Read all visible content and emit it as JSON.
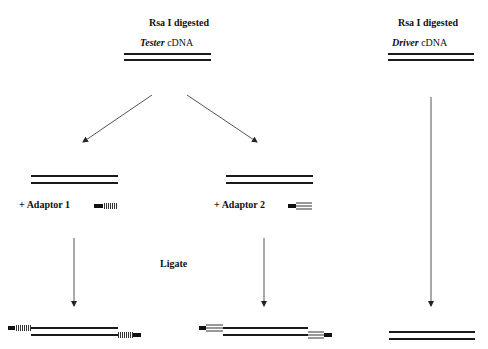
{
  "diagram": {
    "tester": {
      "header_line1": "Rsa I digested",
      "header_italic": "Tester",
      "header_suffix": " cDNA"
    },
    "driver": {
      "header_line1": "Rsa I digested",
      "header_italic": "Driver",
      "header_suffix": " cDNA"
    },
    "branch1": {
      "label": "+ Adaptor 1",
      "adaptor_style": "black-block-with-vertical-hatch"
    },
    "branch2": {
      "label": "+ Adaptor 2",
      "adaptor_style": "black-block-with-horizontal-stripes"
    },
    "step_label": "Ligate",
    "colors": {
      "line": "#1a1a1a",
      "arrow": "#555555",
      "background": "#ffffff"
    }
  }
}
